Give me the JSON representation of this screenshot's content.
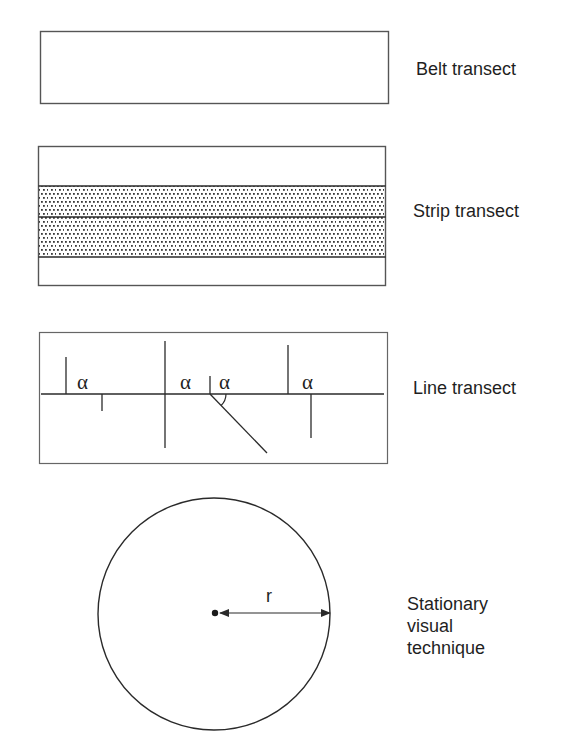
{
  "figure": {
    "panels": [
      {
        "id": "belt",
        "label": "Belt transect"
      },
      {
        "id": "strip",
        "label": "Strip transect"
      },
      {
        "id": "line",
        "label": "Line transect",
        "angle_symbol": "α",
        "angle_labels": [
          "α",
          "α",
          "α",
          "α"
        ]
      },
      {
        "id": "stationary",
        "label_lines": [
          "Stationary",
          "visual",
          "technique"
        ],
        "radius_label": "r"
      }
    ]
  },
  "colors": {
    "stroke": "#2a2a2a",
    "box_stroke": "#555555",
    "stipple": "#3a3a3a",
    "background": "#ffffff",
    "text": "#1f1f1f"
  }
}
